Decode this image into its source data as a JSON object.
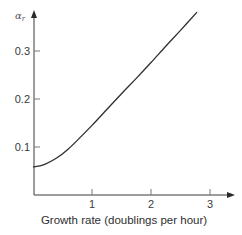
{
  "chart_data": {
    "type": "line",
    "title": "",
    "xlabel": "Growth rate (doublings per hour)",
    "ylabel": "α_r",
    "xlim": [
      0,
      3.3
    ],
    "ylim": [
      0,
      0.4
    ],
    "x_ticks": [
      "1",
      "2",
      "3"
    ],
    "y_ticks": [
      "0.1",
      "0.2",
      "0.3"
    ],
    "grid": false,
    "legend": null,
    "series": [
      {
        "name": "α_r",
        "x": [
          0.0,
          0.2,
          0.4,
          0.6,
          0.8,
          1.0,
          1.25,
          1.5,
          1.75,
          2.0,
          2.25,
          2.5,
          2.78
        ],
        "y": [
          0.058,
          0.064,
          0.077,
          0.096,
          0.12,
          0.145,
          0.178,
          0.211,
          0.243,
          0.276,
          0.31,
          0.343,
          0.381
        ]
      }
    ]
  },
  "labels": {
    "ylabel_main": "α",
    "ylabel_sub": "r",
    "xlabel": "Growth rate (doublings per hour)",
    "xtick_1": "1",
    "xtick_2": "2",
    "xtick_3": "3",
    "ytick_1": "0.1",
    "ytick_2": "0.2",
    "ytick_3": "0.3"
  }
}
